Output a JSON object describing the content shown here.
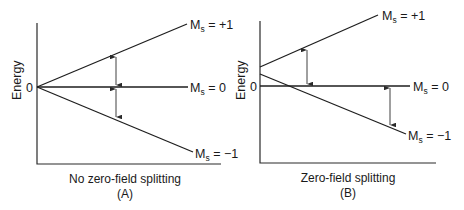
{
  "figure": {
    "panels": [
      {
        "id": "A",
        "y_axis_label": "Energy",
        "zero_tick_label": "0",
        "caption_line1": "No zero-field splitting",
        "caption_line2": "(A)",
        "levels": [
          {
            "name": "Ms = +1",
            "main": "M",
            "sub": "s",
            "value": " = +1"
          },
          {
            "name": "Ms = 0",
            "main": "M",
            "sub": "s",
            "value": " = 0"
          },
          {
            "name": "Ms = -1",
            "main": "M",
            "sub": "s",
            "value": " = −1"
          }
        ],
        "description": "Three levels diverge linearly from a common point at zero energy; equal spacing shown by two double-headed arrows."
      },
      {
        "id": "B",
        "y_axis_label": "Energy",
        "zero_tick_label": "0",
        "caption_line1": "Zero-field splitting",
        "caption_line2": "(B)",
        "levels": [
          {
            "name": "Ms = +1",
            "main": "M",
            "sub": "s",
            "value": " = +1"
          },
          {
            "name": "Ms = 0",
            "main": "M",
            "sub": "s",
            "value": " = 0"
          },
          {
            "name": "Ms = -1",
            "main": "M",
            "sub": "s",
            "value": " = −1"
          }
        ],
        "description": "Ms = ±1 levels start above zero at zero field; Ms = -1 crosses Ms = 0; unequal spacing shown by two double-headed arrows."
      }
    ],
    "line_color": "#1e1e1e",
    "background": "#ffffff"
  }
}
